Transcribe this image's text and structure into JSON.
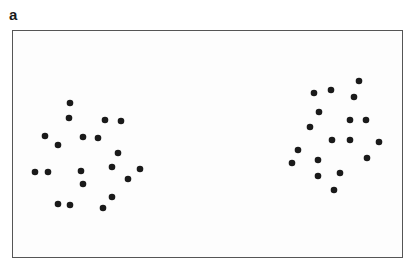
{
  "panel_label": "a",
  "colors": {
    "dot": "#1a1a1a",
    "frame": "#555555",
    "background": "#ffffff"
  },
  "chart_data": {
    "type": "scatter",
    "title": "",
    "xlabel": "",
    "ylabel": "",
    "grid": false,
    "legend": null,
    "axes_ticks": false,
    "frame_px": {
      "left": 12,
      "top": 30,
      "right": 403,
      "bottom": 258
    },
    "series": [
      {
        "name": "left-cluster",
        "points": [
          [
            70,
            103
          ],
          [
            69,
            118
          ],
          [
            105,
            120
          ],
          [
            121,
            121
          ],
          [
            45,
            136
          ],
          [
            58,
            145
          ],
          [
            83,
            137
          ],
          [
            98,
            138
          ],
          [
            118,
            153
          ],
          [
            35,
            172
          ],
          [
            48,
            172
          ],
          [
            81,
            171
          ],
          [
            112,
            167
          ],
          [
            140,
            169
          ],
          [
            83,
            184
          ],
          [
            128,
            179
          ],
          [
            58,
            204
          ],
          [
            70,
            205
          ],
          [
            112,
            197
          ],
          [
            103,
            208
          ]
        ]
      },
      {
        "name": "right-cluster",
        "points": [
          [
            359,
            81
          ],
          [
            314,
            93
          ],
          [
            331,
            90
          ],
          [
            354,
            97
          ],
          [
            319,
            112
          ],
          [
            350,
            120
          ],
          [
            366,
            120
          ],
          [
            310,
            127
          ],
          [
            332,
            140
          ],
          [
            350,
            140
          ],
          [
            379,
            142
          ],
          [
            298,
            150
          ],
          [
            292,
            163
          ],
          [
            318,
            160
          ],
          [
            367,
            158
          ],
          [
            318,
            176
          ],
          [
            340,
            173
          ],
          [
            334,
            190
          ]
        ]
      }
    ]
  }
}
